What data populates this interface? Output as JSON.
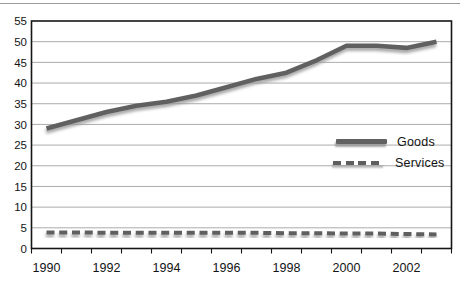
{
  "chart_data": {
    "type": "line",
    "title": "",
    "xlabel": "",
    "ylabel": "",
    "x": [
      1990,
      1991,
      1992,
      1993,
      1994,
      1995,
      1996,
      1997,
      1998,
      1999,
      2000,
      2001,
      2002,
      2003
    ],
    "xtick_labels": [
      "1990",
      "1992",
      "1994",
      "1996",
      "1998",
      "2000",
      "2002"
    ],
    "yticks": [
      0,
      5,
      10,
      15,
      20,
      25,
      30,
      35,
      40,
      45,
      50,
      55
    ],
    "ylim": [
      0,
      55
    ],
    "grid": true,
    "legend_position": "middle-right",
    "series": [
      {
        "name": "Goods",
        "style": "solid",
        "color": "#616161",
        "values": [
          29,
          31,
          33,
          34.5,
          35.5,
          37,
          39,
          41,
          42.5,
          45.5,
          49,
          49,
          48.5,
          50
        ]
      },
      {
        "name": "Services",
        "style": "dashed",
        "color": "#5e5e5e",
        "values": [
          3.9,
          3.9,
          3.8,
          3.8,
          3.8,
          3.8,
          3.8,
          3.8,
          3.7,
          3.7,
          3.6,
          3.6,
          3.5,
          3.4
        ]
      }
    ],
    "colors": {
      "axis": "#161616",
      "gridline": "#ababab",
      "tick_text": "#141414",
      "line_shadow": "#989898",
      "background": "#ffffff"
    }
  }
}
